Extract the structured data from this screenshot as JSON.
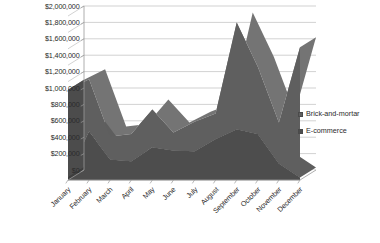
{
  "chart_data": {
    "type": "area",
    "subtype": "stacked-area-3d",
    "title": "",
    "xlabel": "",
    "ylabel": "",
    "ylim": [
      0,
      2000000
    ],
    "ytick_step": 200000,
    "grid": true,
    "legend_position": "right",
    "categories": [
      "January",
      "February",
      "March",
      "April",
      "May",
      "June",
      "July",
      "August",
      "September",
      "October",
      "November",
      "December"
    ],
    "ytick_labels": [
      "$0",
      "$200,000",
      "$400,000",
      "$600,000",
      "$800,000",
      "$1,000,000",
      "$1,200,000",
      "$1,400,000",
      "$1,600,000",
      "$1,800,000",
      "$2,000,000"
    ],
    "series": [
      {
        "name": "E-commerce",
        "color": "#4d4d4d",
        "values": [
          40000,
          590000,
          250000,
          230000,
          400000,
          360000,
          350000,
          500000,
          620000,
          560000,
          200000,
          30000
        ]
      },
      {
        "name": "Brick-and-mortar",
        "color": "#5f5f5f",
        "values": [
          1060000,
          640000,
          280000,
          330000,
          460000,
          220000,
          360000,
          310000,
          1300000,
          820000,
          500000,
          1590000
        ]
      }
    ],
    "totals": [
      1100000,
      1230000,
      530000,
      560000,
      860000,
      580000,
      710000,
      810000,
      1920000,
      1380000,
      700000,
      1620000
    ]
  },
  "legend": {
    "items": [
      {
        "label": "Brick-and-mortar",
        "color": "#5f5f5f"
      },
      {
        "label": "E-commerce",
        "color": "#4d4d4d"
      }
    ]
  },
  "style": {
    "plot_background": "#ffffff",
    "gridline_color": "#b4b4b4",
    "axis_color": "#9a9a9a",
    "text_color": "#2b2b2b"
  }
}
